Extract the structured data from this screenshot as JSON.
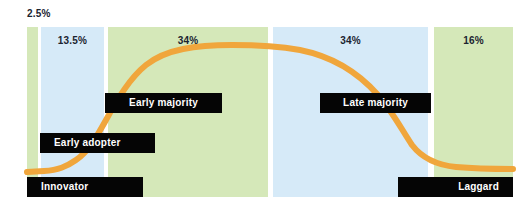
{
  "chart_data": {
    "type": "area",
    "title": "",
    "subtitle": "",
    "xlabel": "",
    "ylabel": "",
    "grid": false,
    "legend": "none",
    "categories": [
      "Innovator",
      "Early adopter",
      "Early majority",
      "Late majority",
      "Laggard"
    ],
    "values": [
      2.5,
      13.5,
      34,
      34,
      16
    ],
    "value_labels": [
      "2.5%",
      "13.5%",
      "34%",
      "34%",
      "16%"
    ],
    "series": [
      {
        "name": "Cumulative adoption",
        "x": [
          0,
          5,
          10,
          15,
          20,
          25,
          30,
          35,
          40,
          45,
          50,
          55,
          60,
          65,
          70,
          75,
          80,
          85,
          90,
          95,
          100
        ],
        "values": [
          2,
          2.5,
          3,
          4,
          6,
          11,
          20,
          33,
          48,
          62,
          74,
          83,
          89,
          93,
          95,
          95,
          93,
          85,
          68,
          45,
          32
        ]
      }
    ],
    "colors": {
      "band_green": "#d5e8b9",
      "band_blue": "#d6eaf8",
      "curve_orange": "#f0a63c",
      "callout_bg": "#050505",
      "callout_text": "#ffffff",
      "label_text": "#1b2430",
      "background": "#ffffff"
    }
  },
  "outside_labels": [
    {
      "id": "innovator-pct",
      "text": "2.5%",
      "x": 27,
      "y": 8
    }
  ],
  "bands": [
    {
      "id": "band-innovator",
      "name": "Innovator",
      "color": "#d5e8b9",
      "left": 27,
      "width": 11,
      "pct": "",
      "show_pct": false
    },
    {
      "id": "band-early-adopter",
      "name": "Early adopter",
      "color": "#d6eaf8",
      "left": 41,
      "width": 63,
      "pct": "13.5%",
      "show_pct": true
    },
    {
      "id": "band-early-majority",
      "name": "Early majority",
      "color": "#d5e8b9",
      "left": 108,
      "width": 160,
      "pct": "34%",
      "show_pct": true
    },
    {
      "id": "band-late-majority",
      "name": "Late majority",
      "color": "#d6eaf8",
      "left": 273,
      "width": 155,
      "pct": "34%",
      "show_pct": true
    },
    {
      "id": "band-laggard",
      "name": "Laggard",
      "color": "#d5e8b9",
      "left": 434,
      "width": 79,
      "pct": "16%",
      "show_pct": true
    }
  ],
  "callouts": [
    {
      "id": "callout-early-majority",
      "label": "Early majority",
      "left": 105,
      "top": 93,
      "width": 117,
      "align": "align-center"
    },
    {
      "id": "callout-late-majority",
      "label": "Late majority",
      "left": 320,
      "top": 93,
      "width": 111,
      "align": "align-center"
    },
    {
      "id": "callout-early-adopter",
      "label": "Early adopter",
      "left": 40,
      "top": 133,
      "width": 115,
      "align": "align-left"
    },
    {
      "id": "callout-innovator",
      "label": "Innovator",
      "left": 27,
      "top": 177,
      "width": 116,
      "align": "align-left"
    },
    {
      "id": "callout-laggard",
      "label": "Laggard",
      "left": 398,
      "top": 177,
      "width": 115,
      "align": "align-right"
    }
  ],
  "curve": {
    "name": "adoption-s-curve",
    "color": "#f0a63c",
    "stroke_width": 6,
    "path": "M 27,172 L 44,171 C 58,170 66,167 76,160 C 88,152 96,138 106,120 C 118,98 130,78 146,65 C 166,49 196,45 232,45 C 258,45 278,46 300,50 C 330,56 356,70 378,95 C 392,111 402,130 412,145 C 422,158 436,165 456,167 C 478,169 498,169 513,169"
  }
}
